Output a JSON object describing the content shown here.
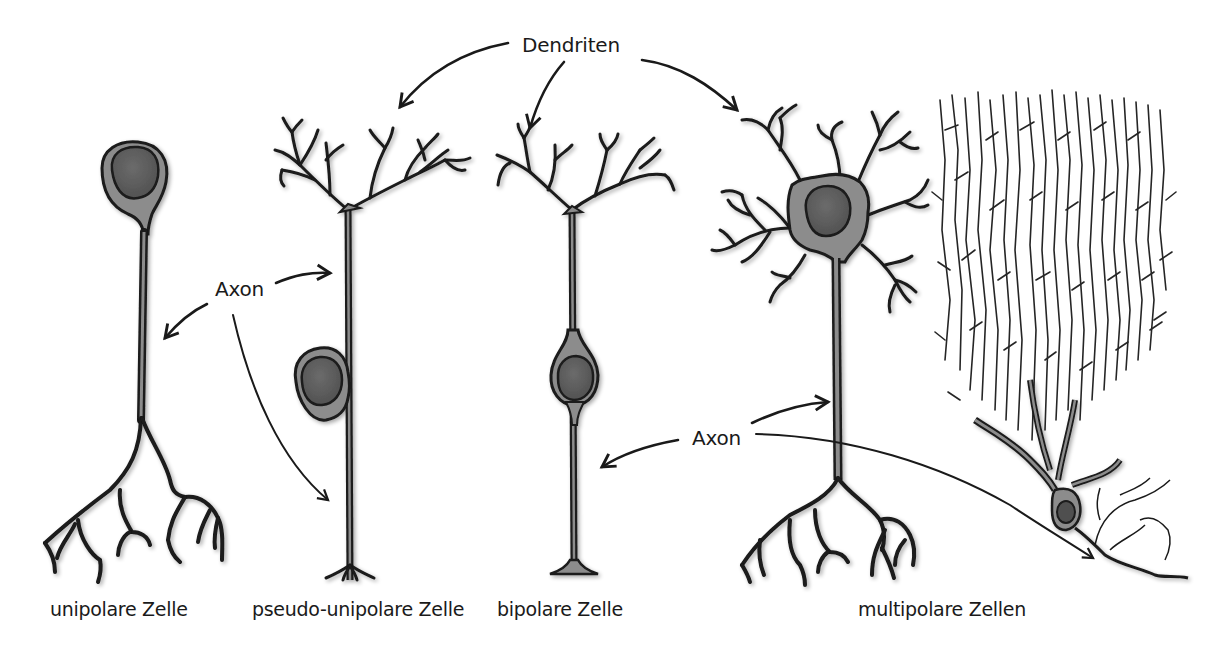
{
  "diagram": {
    "callouts": {
      "dendrites": "Dendriten",
      "axon_left": "Axon",
      "axon_right": "Axon"
    },
    "cells": [
      {
        "id": "unipolar",
        "label": "unipolare Zelle"
      },
      {
        "id": "pseudo-unipolar",
        "label": "pseudo-unipolare Zelle"
      },
      {
        "id": "bipolar",
        "label": "bipolare Zelle"
      },
      {
        "id": "multipolar",
        "label": "multipolare Zellen"
      }
    ],
    "colors": {
      "background": "#ffffff",
      "outline": "#1a1a1a",
      "cytoplasm": "#8c8c8c",
      "nucleus": "#5e5e5e",
      "text": "#1a1a1a"
    }
  }
}
